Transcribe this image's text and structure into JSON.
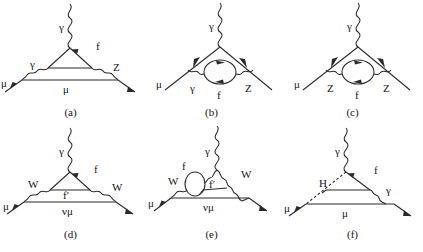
{
  "figure": {
    "kind": "feynman-diagram-set",
    "count": 6,
    "background_color": "#ffffff",
    "line_color": "#2a2a2a",
    "text_color": "#151515",
    "layout": "2 rows x 3 columns"
  },
  "panels": [
    {
      "id": "a",
      "caption": "(a)",
      "row": 0,
      "col": 0,
      "description": "Electroweak gamma-Z mixing vertex correction with internal fermion triangle",
      "particles": [
        "gamma",
        "f",
        "gamma",
        "Z",
        "mu",
        "mu"
      ],
      "labels": {
        "top_photon": "γ",
        "loop_fermion": "f",
        "left_boson": "γ",
        "right_boson": "Z",
        "incoming_lepton": "μ",
        "bottom_lepton": "μ"
      },
      "line_types": {
        "top_photon": "wavy",
        "left_boson": "wavy",
        "right_boson": "wavy",
        "lepton": "solid",
        "loop_fermion": "solid"
      }
    },
    {
      "id": "b",
      "caption": "(b)",
      "row": 0,
      "col": 1,
      "description": "Vertex correction with gamma-Z vacuum polarization fermion bubble loop",
      "particles": [
        "gamma",
        "gamma",
        "f",
        "Z",
        "mu"
      ],
      "labels": {
        "top_photon": "γ",
        "left_boson": "γ",
        "loop_fermion": "f",
        "right_boson": "Z",
        "incoming_lepton": "μ"
      },
      "line_types": {
        "top_photon": "wavy",
        "left_boson": "wavy",
        "right_boson": "wavy",
        "lepton": "solid",
        "loop_fermion": "solid-circle"
      }
    },
    {
      "id": "c",
      "caption": "(c)",
      "row": 0,
      "col": 2,
      "description": "Vertex correction with Z-Z vacuum polarization fermion bubble loop",
      "particles": [
        "gamma",
        "Z",
        "f",
        "Z",
        "mu"
      ],
      "labels": {
        "top_photon": "γ",
        "left_boson": "Z",
        "loop_fermion": "f",
        "right_boson": "Z",
        "incoming_lepton": "μ"
      },
      "line_types": {
        "top_photon": "wavy",
        "left_boson": "wavy",
        "right_boson": "wavy",
        "lepton": "solid",
        "loop_fermion": "solid-circle"
      }
    },
    {
      "id": "d",
      "caption": "(d)",
      "row": 1,
      "col": 0,
      "description": "Charged current W-boson vertex correction with internal fermion triangle and muon neutrino line",
      "particles": [
        "gamma",
        "f",
        "W",
        "f'",
        "W",
        "mu",
        "nu_mu"
      ],
      "labels": {
        "top_photon": "γ",
        "loop_fermion": "f",
        "left_boson": "W",
        "inner_fermion": "f′",
        "right_boson": "W",
        "incoming_lepton": "μ",
        "bottom_line": "νμ"
      },
      "line_types": {
        "top_photon": "wavy",
        "left_boson": "wavy",
        "right_boson": "wavy",
        "lepton": "solid",
        "loop_fermion": "solid"
      }
    },
    {
      "id": "e",
      "caption": "(e)",
      "row": 1,
      "col": 1,
      "description": "W-boson vertex correction with fermion bubble loop attached to the photon",
      "particles": [
        "gamma",
        "f",
        "W",
        "f'",
        "W",
        "mu",
        "nu_mu"
      ],
      "labels": {
        "top_photon": "γ",
        "loop_fermion": "f",
        "left_boson": "W",
        "inner_fermion": "f′",
        "right_boson": "W",
        "incoming_lepton": "μ",
        "bottom_line": "νμ"
      },
      "line_types": {
        "top_photon": "wavy",
        "left_boson": "wavy",
        "right_boson": "wavy",
        "lepton": "solid",
        "loop_fermion": "solid-circle"
      }
    },
    {
      "id": "f",
      "caption": "(f)",
      "row": 1,
      "col": 2,
      "description": "Higgs boson exchange vertex correction with internal fermion and photon emission",
      "particles": [
        "gamma",
        "f",
        "H",
        "gamma",
        "mu",
        "mu"
      ],
      "labels": {
        "top_photon": "γ",
        "loop_fermion": "f",
        "higgs": "H",
        "right_boson": "γ",
        "incoming_lepton": "μ",
        "bottom_lepton": "μ"
      },
      "line_types": {
        "top_photon": "wavy",
        "higgs": "dashed",
        "right_boson": "wavy",
        "lepton": "solid",
        "loop_fermion": "solid"
      }
    }
  ]
}
